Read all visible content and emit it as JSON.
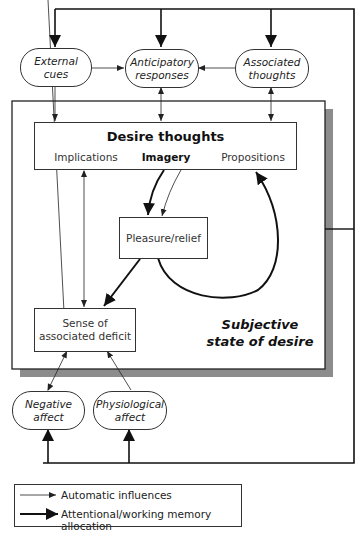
{
  "diagram": {
    "nodes": {
      "external_cues": {
        "line1": "External",
        "line2": "cues"
      },
      "anticipatory_responses": {
        "line1": "Anticipatory",
        "line2": "responses"
      },
      "associated_thoughts": {
        "line1": "Associated",
        "line2": "thoughts"
      },
      "desire_thoughts": {
        "title": "Desire thoughts",
        "implications": "Implications",
        "imagery": "Imagery",
        "propositions": "Propositions"
      },
      "pleasure_relief": {
        "label": "Pleasure/relief"
      },
      "sense_of_deficit": {
        "line1": "Sense of",
        "line2": "associated deficit"
      },
      "negative_affect": {
        "line1": "Negative",
        "line2": "affect"
      },
      "physiological_affect": {
        "line1": "Physiological",
        "line2": "affect"
      }
    },
    "region_label": {
      "line1": "Subjective",
      "line2": "state of desire"
    },
    "colors": {
      "line": "#222222",
      "shadow": "#8c8c8c",
      "box_fill": "#ffffff"
    }
  },
  "legend": {
    "items": [
      {
        "label": "Automatic influences",
        "style": "thin"
      },
      {
        "label": "Attentional/working memory allocation",
        "style": "thick"
      }
    ]
  }
}
